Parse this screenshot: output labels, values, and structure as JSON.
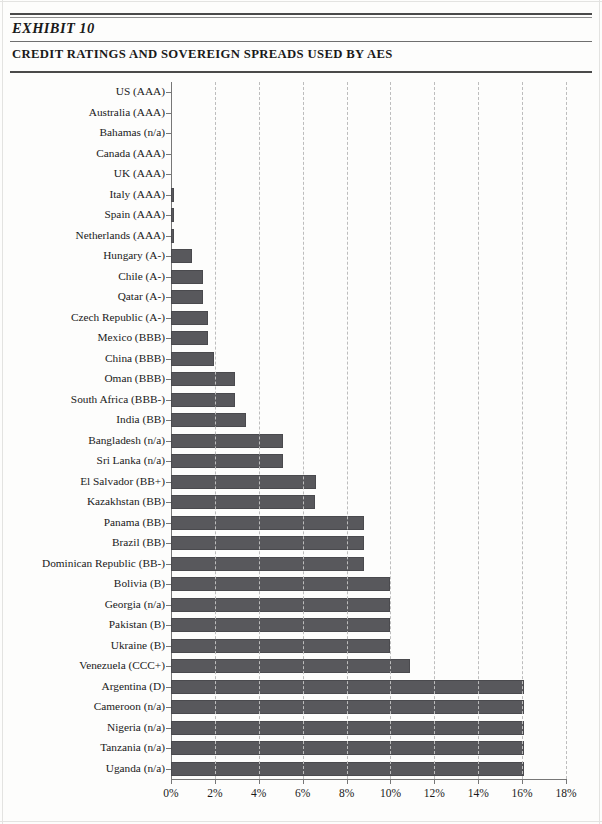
{
  "header": {
    "exhibit_label": "EXHIBIT 10",
    "exhibit_title": "CREDIT RATINGS AND SOVEREIGN SPREADS USED BY AES"
  },
  "chart_data": {
    "type": "bar",
    "orientation": "horizontal",
    "title": "CREDIT RATINGS AND SOVEREIGN SPREADS USED BY AES",
    "xlabel": "",
    "ylabel": "",
    "xlim": [
      0,
      18
    ],
    "grid": true,
    "legend": false,
    "bar_color": "#58585c",
    "xticklabels": [
      "0%",
      "2%",
      "4%",
      "6%",
      "8%",
      "10%",
      "12%",
      "14%",
      "16%",
      "18%"
    ],
    "xticks": [
      0,
      2,
      4,
      6,
      8,
      10,
      12,
      14,
      16,
      18
    ],
    "categories": [
      "US (AAA)",
      "Australia (AAA)",
      "Bahamas (n/a)",
      "Canada (AAA)",
      "UK (AAA)",
      "Italy (AAA)",
      "Spain (AAA)",
      "Netherlands (AAA)",
      "Hungary (A-)",
      "Chile (A-)",
      "Qatar (A-)",
      "Czech Republic (A-)",
      "Mexico (BBB)",
      "China (BBB)",
      "Oman (BBB)",
      "South Africa (BBB-)",
      "India (BB)",
      "Bangladesh (n/a)",
      "Sri Lanka (n/a)",
      "El Salvador (BB+)",
      "Kazakhstan (BB)",
      "Panama (BB)",
      "Brazil (BB)",
      "Dominican Republic (BB-)",
      "Bolivia (B)",
      "Georgia (n/a)",
      "Pakistan (B)",
      "Ukraine (B)",
      "Venezuela (CCC+)",
      "Argentina (D)",
      "Cameroon (n/a)",
      "Nigeria (n/a)",
      "Tanzania (n/a)",
      "Uganda (n/a)"
    ],
    "values": [
      0.0,
      0.0,
      0.0,
      0.0,
      0.0,
      0.15,
      0.15,
      0.15,
      0.95,
      1.45,
      1.45,
      1.7,
      1.7,
      1.95,
      2.9,
      2.9,
      3.4,
      5.1,
      5.1,
      6.6,
      6.55,
      8.8,
      8.8,
      8.8,
      10.0,
      10.0,
      10.0,
      10.0,
      10.9,
      16.1,
      16.1,
      16.1,
      16.1,
      16.1
    ]
  }
}
